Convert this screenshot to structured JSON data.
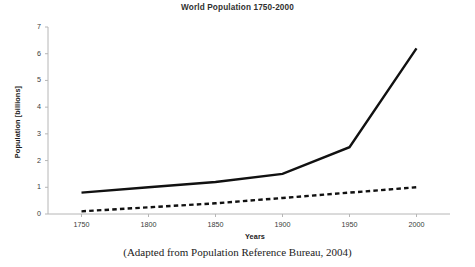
{
  "figure": {
    "caption": "(Adapted from Population Reference Bureau, 2004)",
    "background_color": "#ffffff",
    "axis_color": "#b6b6b6",
    "line_color": "#111111"
  },
  "chart_data": {
    "type": "line",
    "title": "World Population 1750-2000",
    "xlabel": "Years",
    "ylabel": "Population [billions]",
    "x": [
      1750,
      1800,
      1850,
      1900,
      1950,
      2000
    ],
    "xlim": [
      1725,
      2025
    ],
    "ylim": [
      0,
      7
    ],
    "xticks": [
      1750,
      1800,
      1850,
      1900,
      1950,
      2000
    ],
    "xtick_labels": [
      "1750",
      "1800",
      "1850",
      "1900",
      "1950",
      "2000"
    ],
    "yticks": [
      0,
      1,
      2,
      3,
      4,
      5,
      6,
      7
    ],
    "ytick_labels": [
      "0",
      "1",
      "2",
      "3",
      "4",
      "5",
      "6",
      "7"
    ],
    "grid": false,
    "legend": null,
    "series": [
      {
        "name": "World total population",
        "style": "solid",
        "color": "#111111",
        "width": 2.4,
        "values": [
          0.8,
          1.0,
          1.2,
          1.5,
          2.5,
          6.2
        ]
      },
      {
        "name": "Less developed regions increment",
        "style": "dashed",
        "color": "#111111",
        "width": 2.4,
        "values": [
          0.1,
          0.25,
          0.4,
          0.6,
          0.8,
          1.0
        ]
      }
    ]
  }
}
